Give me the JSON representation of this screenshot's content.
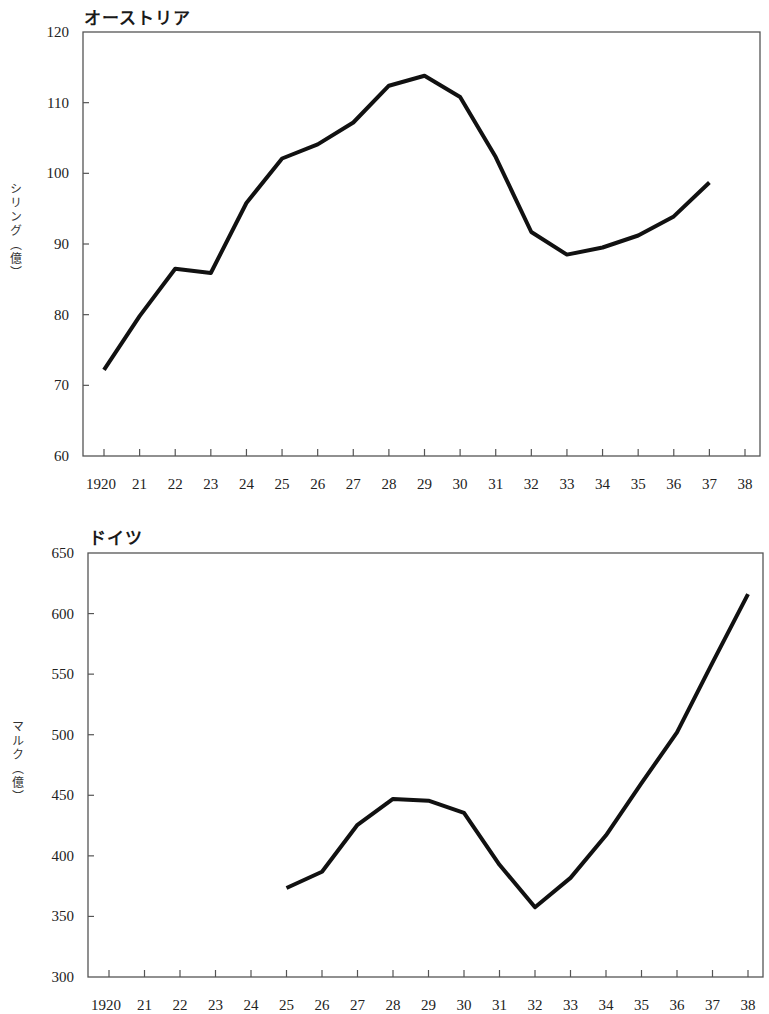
{
  "chart_data": [
    {
      "type": "line",
      "title": "オーストリア",
      "xlabel": "",
      "ylabel": "シリング（億）",
      "ylim": [
        60,
        120
      ],
      "yticks": [
        60,
        70,
        80,
        90,
        100,
        110,
        120
      ],
      "x_tick_labels": [
        "1920",
        "21",
        "22",
        "23",
        "24",
        "25",
        "26",
        "27",
        "28",
        "29",
        "30",
        "31",
        "32",
        "33",
        "34",
        "35",
        "36",
        "37",
        "38"
      ],
      "x": [
        1920,
        1921,
        1922,
        1923,
        1924,
        1925,
        1926,
        1927,
        1928,
        1929,
        1930,
        1931,
        1932,
        1933,
        1934,
        1935,
        1936,
        1937,
        1938
      ],
      "grid": false,
      "legend": null,
      "series": [
        {
          "name": "オーストリア",
          "values": [
            72.2,
            79.8,
            86.5,
            85.9,
            95.8,
            102.1,
            104.1,
            107.2,
            112.4,
            113.8,
            110.8,
            102.3,
            91.7,
            88.5,
            89.5,
            91.2,
            93.9,
            98.7,
            null
          ]
        }
      ]
    },
    {
      "type": "line",
      "title": "ドイツ",
      "xlabel": "",
      "ylabel": "マルク（億）",
      "ylim": [
        300,
        650
      ],
      "yticks": [
        300,
        350,
        400,
        450,
        500,
        550,
        600,
        650
      ],
      "x_tick_labels": [
        "1920",
        "21",
        "22",
        "23",
        "24",
        "25",
        "26",
        "27",
        "28",
        "29",
        "30",
        "31",
        "32",
        "33",
        "34",
        "35",
        "36",
        "37",
        "38"
      ],
      "x": [
        1920,
        1921,
        1922,
        1923,
        1924,
        1925,
        1926,
        1927,
        1928,
        1929,
        1930,
        1931,
        1932,
        1933,
        1934,
        1935,
        1936,
        1937,
        1938
      ],
      "grid": false,
      "legend": null,
      "series": [
        {
          "name": "ドイツ",
          "values": [
            null,
            null,
            null,
            null,
            null,
            373.5,
            386.8,
            425.6,
            447,
            445.5,
            435.5,
            392.6,
            357.5,
            381.8,
            417,
            460,
            502,
            559.5,
            616
          ]
        }
      ]
    }
  ],
  "charts": {
    "austria": {
      "title": "オーストリア",
      "ylabel": "シリング（億）"
    },
    "germany": {
      "title": "ドイツ",
      "ylabel": "マルク（億）"
    }
  },
  "style": {
    "line_color": "#111111",
    "axis_color": "#555555"
  }
}
